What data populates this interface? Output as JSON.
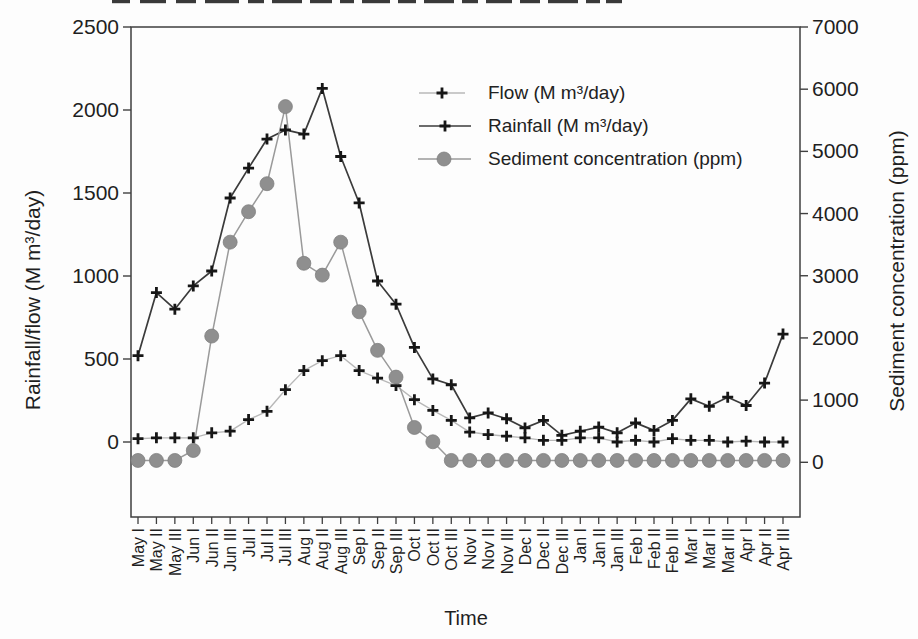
{
  "figure": {
    "kind": "scanned-book-figure",
    "top_cropped_text_artifact": true,
    "background_color": "#fdfdfd",
    "frame_color": "#3f3f3f"
  },
  "chart_data": {
    "type": "line",
    "title": "",
    "xlabel": "Time",
    "ylabel_left": "Rainfall/flow (M m³/day)",
    "ylabel_right": "Sediment concentration (ppm)",
    "grid": false,
    "legend_position": "inside-top-right",
    "left_axis": {
      "min": 0,
      "max": 2500,
      "ticks": [
        2500,
        2000,
        1500,
        1000,
        500,
        0
      ]
    },
    "right_axis": {
      "min": 0,
      "max": 7000,
      "ticks": [
        7000,
        6000,
        5000,
        4000,
        3000,
        2000,
        1000,
        0
      ]
    },
    "categories": [
      "May I",
      "May II",
      "May III",
      "Jun I",
      "Jun II",
      "Jun III",
      "Jul I",
      "Jul II",
      "Jul III",
      "Aug I",
      "Aug II",
      "Aug III",
      "Sep I",
      "Sep II",
      "Sep III",
      "Oct I",
      "Oct II",
      "Oct III",
      "Nov I",
      "Nov II",
      "Nov III",
      "Dec I",
      "Dec II",
      "Dec III",
      "Jan I",
      "Jan II",
      "Jan III",
      "Feb I",
      "Feb II",
      "Feb III",
      "Mar I",
      "Mar II",
      "Mar III",
      "Apr I",
      "Apr II",
      "Apr III"
    ],
    "series": [
      {
        "name": "Flow (M m³/day)",
        "axis": "left",
        "marker": "plus",
        "marker_color": "#161616",
        "line_color": "#b8b8b8",
        "values": [
          20,
          25,
          25,
          25,
          55,
          65,
          135,
          185,
          315,
          430,
          490,
          520,
          430,
          385,
          340,
          255,
          190,
          130,
          60,
          45,
          35,
          25,
          10,
          10,
          25,
          25,
          0,
          10,
          0,
          20,
          10,
          10,
          0,
          5,
          0,
          0
        ]
      },
      {
        "name": "Rainfall (M m³/day)",
        "axis": "left",
        "marker": "plus",
        "marker_color": "#161616",
        "line_color": "#3b3b3b",
        "values": [
          520,
          900,
          800,
          940,
          1030,
          1470,
          1650,
          1825,
          1880,
          1855,
          2130,
          1720,
          1440,
          970,
          830,
          570,
          380,
          345,
          145,
          175,
          140,
          85,
          130,
          40,
          65,
          90,
          55,
          115,
          70,
          130,
          260,
          215,
          270,
          220,
          355,
          650
        ]
      },
      {
        "name": "Sediment concentration (ppm)",
        "axis": "right",
        "marker": "circle",
        "marker_color": "#8f8f8f",
        "line_color": "#9a9a9a",
        "values": [
          30,
          30,
          30,
          190,
          2030,
          3540,
          4030,
          4480,
          5720,
          3200,
          3010,
          3540,
          2420,
          1800,
          1370,
          560,
          330,
          30,
          30,
          30,
          30,
          30,
          30,
          30,
          30,
          30,
          30,
          30,
          30,
          30,
          30,
          30,
          30,
          30,
          30,
          30
        ]
      }
    ]
  }
}
